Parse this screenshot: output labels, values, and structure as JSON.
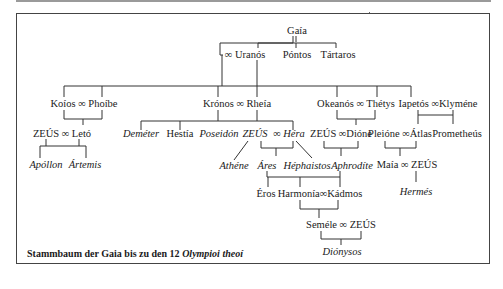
{
  "diagram": {
    "title": "Stammbaum der Gaia bis zu den 12 Olympioi theoí",
    "caption": {
      "prefix": "Stammbaum der Gaia bis zu den 12 ",
      "italic": "Olympioi theoí"
    },
    "marriage_symbol": "∞",
    "nodes": {
      "gaia": "Gaía",
      "uranos": "∞ Uranós",
      "pontos": "Póntos",
      "tartaros": "Tártaros",
      "koios_phoibe": "Koíos ∞ Phoíbe",
      "kronos_rheia": "Krónos ∞ Rheía",
      "okeanos_thetys": "Okeanós ∞ Thétys",
      "iapetos_klymene": "Iapetós ∞Klyméne",
      "zeus_leto": "ZEÚS ∞ Letó",
      "demeter": "Deméter",
      "hestia": "Hestía",
      "poseidon": "Poseidón",
      "zeus_hera_zeus": "ZEÚS",
      "zeus_hera_sym": "∞",
      "zeus_hera_hera": "Héra",
      "zeus_dione": "ZEÚS ∞Dióne",
      "pleione_atlas": "Pleióne ∞Átlas",
      "prometheus": "Prometheús",
      "apollon": "Apóllon",
      "artemis": "Ártemis",
      "athene": "Athéne",
      "ares": "Áres",
      "hephaistos": "Héphaistos",
      "aphrodite": "Aphrodíte",
      "maia_zeus": "Maía ∞ ZEÚS",
      "eros": "Éros",
      "harmonia_kadmos": "Harmonía∞Kádmos",
      "hermes": "Hermés",
      "semele_zeus": "Seméle ∞ ZEÚS",
      "dionysos": "Diónysos"
    },
    "italic_nodes": [
      "demeter",
      "poseidon",
      "zeus_hera",
      "apollon",
      "artemis",
      "athene",
      "ares",
      "hephaistos",
      "aphrodite",
      "hermes",
      "dionysos"
    ],
    "colors": {
      "line": "#333333",
      "text": "#1a1a1a",
      "frame": "#444444",
      "background": "#ffffff"
    }
  }
}
